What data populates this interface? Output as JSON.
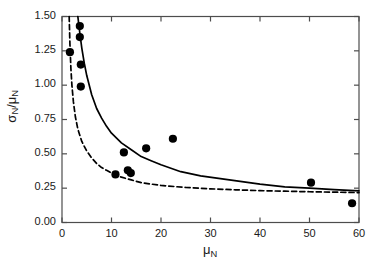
{
  "chart_data": {
    "type": "scatter",
    "title": "",
    "xlabel": "μ_N",
    "ylabel": "σ_N/μ_N",
    "xlabel_main": "μ",
    "xlabel_sub": "N",
    "ylabel_num": "σ",
    "ylabel_num_sub": "N",
    "ylabel_den": "μ",
    "ylabel_den_sub": "N",
    "xlim": [
      0,
      60
    ],
    "ylim": [
      0,
      1.5
    ],
    "grid": false,
    "legend": "none",
    "xticks": [
      0,
      10,
      20,
      30,
      40,
      50,
      60
    ],
    "xtick_labels": [
      "0",
      "10",
      "20",
      "30",
      "40",
      "50",
      "60"
    ],
    "yticks": [
      0.0,
      0.25,
      0.5,
      0.75,
      1.0,
      1.25,
      1.5
    ],
    "ytick_labels": [
      "0.00",
      "0.25",
      "0.50",
      "0.75",
      "1.00",
      "1.25",
      "1.50"
    ],
    "series": [
      {
        "name": "data",
        "type": "scatter",
        "marker": "filled-circle",
        "color": "#000000",
        "points": [
          {
            "x": 3.6,
            "y": 1.43
          },
          {
            "x": 3.6,
            "y": 1.35
          },
          {
            "x": 1.6,
            "y": 1.24
          },
          {
            "x": 3.8,
            "y": 1.15
          },
          {
            "x": 3.8,
            "y": 0.99
          },
          {
            "x": 10.8,
            "y": 0.35
          },
          {
            "x": 12.5,
            "y": 0.51
          },
          {
            "x": 13.3,
            "y": 0.38
          },
          {
            "x": 13.9,
            "y": 0.36
          },
          {
            "x": 17.0,
            "y": 0.54
          },
          {
            "x": 22.4,
            "y": 0.61
          },
          {
            "x": 50.3,
            "y": 0.29
          },
          {
            "x": 58.6,
            "y": 0.14
          }
        ]
      },
      {
        "name": "solid-curve",
        "type": "line",
        "style": "solid",
        "color": "#000000",
        "points": [
          {
            "x": 3.2,
            "y": 1.5
          },
          {
            "x": 3.6,
            "y": 1.38
          },
          {
            "x": 4.0,
            "y": 1.27
          },
          {
            "x": 4.5,
            "y": 1.16
          },
          {
            "x": 5.0,
            "y": 1.07
          },
          {
            "x": 6.0,
            "y": 0.93
          },
          {
            "x": 7.0,
            "y": 0.83
          },
          {
            "x": 8.0,
            "y": 0.76
          },
          {
            "x": 9.0,
            "y": 0.7
          },
          {
            "x": 10.0,
            "y": 0.65
          },
          {
            "x": 12.0,
            "y": 0.58
          },
          {
            "x": 14.0,
            "y": 0.53
          },
          {
            "x": 16.0,
            "y": 0.48
          },
          {
            "x": 18.0,
            "y": 0.45
          },
          {
            "x": 20.0,
            "y": 0.42
          },
          {
            "x": 24.0,
            "y": 0.37
          },
          {
            "x": 28.0,
            "y": 0.34
          },
          {
            "x": 32.0,
            "y": 0.32
          },
          {
            "x": 36.0,
            "y": 0.3
          },
          {
            "x": 40.0,
            "y": 0.28
          },
          {
            "x": 45.0,
            "y": 0.26
          },
          {
            "x": 50.0,
            "y": 0.25
          },
          {
            "x": 55.0,
            "y": 0.24
          },
          {
            "x": 60.0,
            "y": 0.23
          }
        ]
      },
      {
        "name": "dashed-curve",
        "type": "line",
        "style": "dashed",
        "color": "#000000",
        "points": [
          {
            "x": 1.45,
            "y": 1.5
          },
          {
            "x": 1.6,
            "y": 1.3
          },
          {
            "x": 1.8,
            "y": 1.12
          },
          {
            "x": 2.0,
            "y": 1.0
          },
          {
            "x": 2.3,
            "y": 0.88
          },
          {
            "x": 2.7,
            "y": 0.77
          },
          {
            "x": 3.2,
            "y": 0.68
          },
          {
            "x": 4.0,
            "y": 0.59
          },
          {
            "x": 5.0,
            "y": 0.52
          },
          {
            "x": 6.0,
            "y": 0.47
          },
          {
            "x": 7.0,
            "y": 0.43
          },
          {
            "x": 8.0,
            "y": 0.4
          },
          {
            "x": 9.0,
            "y": 0.38
          },
          {
            "x": 10.0,
            "y": 0.36
          },
          {
            "x": 12.0,
            "y": 0.33
          },
          {
            "x": 14.0,
            "y": 0.31
          },
          {
            "x": 16.0,
            "y": 0.29
          },
          {
            "x": 18.0,
            "y": 0.28
          },
          {
            "x": 20.0,
            "y": 0.27
          },
          {
            "x": 25.0,
            "y": 0.255
          },
          {
            "x": 30.0,
            "y": 0.245
          },
          {
            "x": 35.0,
            "y": 0.238
          },
          {
            "x": 40.0,
            "y": 0.232
          },
          {
            "x": 45.0,
            "y": 0.228
          },
          {
            "x": 50.0,
            "y": 0.224
          },
          {
            "x": 55.0,
            "y": 0.221
          },
          {
            "x": 60.0,
            "y": 0.218
          }
        ]
      }
    ]
  },
  "axes": {
    "frame_color": "#4d4d4d",
    "tick_color": "#4d4d4d",
    "text_color": "#1a1a1a"
  }
}
